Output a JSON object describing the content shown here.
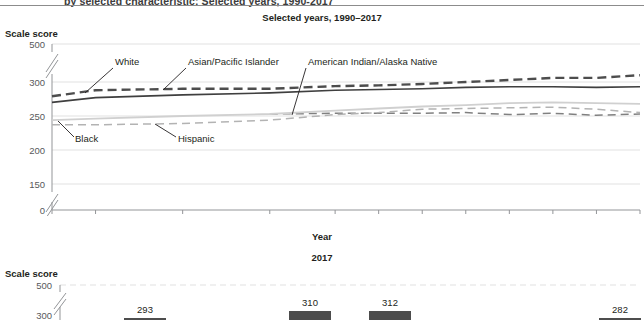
{
  "header": {
    "clipped_title": "by selected characteristic: Selected years, 1990-2017",
    "subtitle_top": "Selected years, 1990–2017",
    "subtitle_bottom": "2017"
  },
  "axes": {
    "y_label_top": "Scale score",
    "y_label_bottom": "Scale score",
    "x_label": "Year"
  },
  "colors": {
    "ink": "#231f20",
    "grid": "#d9d9d9",
    "axis": "#939598",
    "white_series": "#3f3f3f",
    "asian_series": "#4d4d4d",
    "amind_series": "#808080",
    "black_series": "#b3b3b3",
    "hispanic_series": "#d0d0d0",
    "bar_fill": "#4d4d4d"
  },
  "chart_data": [
    {
      "type": "line",
      "title": "Selected years, 1990–2017",
      "xlabel": "Year",
      "ylabel": "Scale score",
      "ylim": [
        0,
        500
      ],
      "y_ticks": [
        0,
        150,
        200,
        250,
        300,
        500
      ],
      "y_axis_break": true,
      "grid": true,
      "legend": "inline-annotations",
      "x_ticks": [
        1990,
        1992,
        1996,
        2000,
        2003,
        2005,
        2007,
        2009,
        2011,
        2013,
        2015,
        2017
      ],
      "xlim": [
        1990,
        2017
      ],
      "series": [
        {
          "name": "White",
          "style": "solid",
          "label_text": "White",
          "x": [
            1990,
            1992,
            1996,
            2000,
            2003,
            2005,
            2007,
            2009,
            2011,
            2013,
            2015,
            2017
          ],
          "values": [
            270,
            277,
            281,
            284,
            288,
            289,
            290,
            292,
            293,
            293,
            292,
            293
          ]
        },
        {
          "name": "Asian/Pacific Islander",
          "style": "dashed",
          "label_text": "Asian/Pacific Islander",
          "x": [
            1990,
            1992,
            1996,
            2000,
            2003,
            2005,
            2007,
            2009,
            2011,
            2013,
            2015,
            2017
          ],
          "values": [
            279,
            288,
            290,
            290,
            294,
            295,
            297,
            300,
            303,
            306,
            306,
            310
          ]
        },
        {
          "name": "American Indian/Alaska Native",
          "style": "dashed",
          "label_text": "American Indian/Alaska Native",
          "x": [
            2000,
            2003,
            2005,
            2007,
            2009,
            2011,
            2013,
            2015,
            2017
          ],
          "values": [
            253,
            254,
            254,
            254,
            255,
            252,
            254,
            251,
            253
          ]
        },
        {
          "name": "Black",
          "style": "dashed",
          "label_text": "Black",
          "x": [
            1990,
            1992,
            1996,
            2000,
            2003,
            2005,
            2007,
            2009,
            2011,
            2013,
            2015,
            2017
          ],
          "values": [
            237,
            237,
            239,
            244,
            252,
            255,
            260,
            261,
            262,
            263,
            260,
            255
          ]
        },
        {
          "name": "Hispanic",
          "style": "solid-light",
          "label_text": "Hispanic",
          "x": [
            1990,
            1992,
            1996,
            2000,
            2003,
            2005,
            2007,
            2009,
            2011,
            2013,
            2015,
            2017
          ],
          "values": [
            244,
            246,
            250,
            253,
            258,
            261,
            264,
            266,
            269,
            270,
            269,
            268
          ]
        }
      ]
    },
    {
      "type": "bar",
      "title": "2017",
      "ylabel": "Scale score",
      "ylim": [
        0,
        500
      ],
      "y_ticks": [
        500,
        300
      ],
      "y_axis_break": true,
      "categories": [
        "Total",
        "White",
        "Asian/Pacific Islander",
        "American Indian/Alaska Native"
      ],
      "values": [
        293,
        310,
        312,
        282
      ],
      "value_labels": [
        "293",
        "310",
        "312",
        "282"
      ]
    }
  ]
}
